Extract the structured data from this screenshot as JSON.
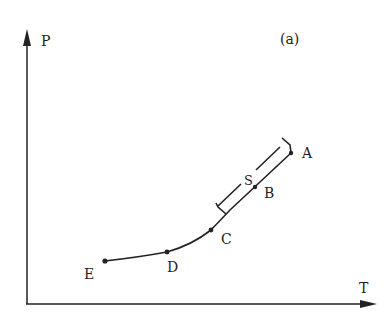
{
  "figure": {
    "panel_label": "(a)",
    "axes": {
      "y_label": "P",
      "x_label": "T"
    },
    "points": [
      {
        "id": "A",
        "label": "A"
      },
      {
        "id": "B",
        "label": "B"
      },
      {
        "id": "C",
        "label": "C"
      },
      {
        "id": "D",
        "label": "D"
      },
      {
        "id": "E",
        "label": "E"
      }
    ],
    "segment_label": "S",
    "colors": {
      "ink": "#222222",
      "background": "#ffffff"
    }
  }
}
